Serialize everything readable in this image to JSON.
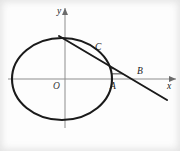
{
  "figure": {
    "kind": "geometry-diagram",
    "width": 180,
    "height": 151,
    "background_color": "#fdfdfd",
    "ink_color": "#1a1a1a",
    "axis_color": "#8d8d8d"
  },
  "axes": {
    "x_axis": {
      "label": "x",
      "label_x": 167,
      "label_y": 82,
      "start_x": 8,
      "end_x": 176,
      "y": 79,
      "has_arrow": true
    },
    "y_axis": {
      "label": "y",
      "label_x": 57,
      "label_y": 7,
      "x": 65,
      "start_y": 128,
      "end_y": 8,
      "has_arrow": true
    },
    "origin": {
      "label": "O",
      "label_x": 53,
      "label_y": 82,
      "x": 65,
      "y": 79
    }
  },
  "ellipse": {
    "center_x": 62,
    "center_y": 79,
    "radius_x": 50,
    "radius_y": 41,
    "stroke_width": 2.1
  },
  "tangent_line": {
    "x1": 59,
    "y1": 36,
    "x2": 167,
    "y2": 100,
    "stroke_width": 2.0
  },
  "points": [
    {
      "label": "C",
      "label_x": 95,
      "label_y": 43,
      "x": 103,
      "y": 62,
      "role": "tangency-point"
    },
    {
      "label": "A",
      "label_x": 110,
      "label_y": 82,
      "x": 111,
      "y": 79,
      "role": "ellipse-x-axis-intersection"
    },
    {
      "label": "B",
      "label_x": 137,
      "label_y": 67,
      "x": 144,
      "y": 79,
      "role": "tangent-x-axis-intersection"
    }
  ],
  "hatched_region": {
    "description": "Horizontal hatch lines filling the curvilinear triangle bounded by the ellipse arc on the left, the tangent line on the right and the x-axis at the bottom.",
    "line_count": 7,
    "orientation": "horizontal",
    "stroke_color": "#222222"
  }
}
